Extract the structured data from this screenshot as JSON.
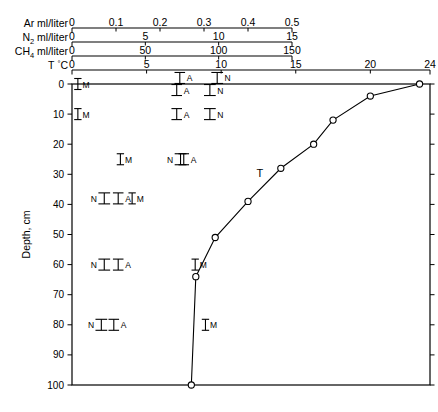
{
  "chart_data": {
    "type": "scatter",
    "title": "",
    "ylabel": "Depth, cm",
    "ylim": [
      0,
      100
    ],
    "y_ticks": [
      0,
      10,
      20,
      30,
      40,
      50,
      60,
      70,
      80,
      90,
      100
    ],
    "grid": false,
    "legend": "inline-letter-labels",
    "top_axes": [
      {
        "id": "ar",
        "name": "Ar",
        "units": "ml/liter",
        "letter": "A",
        "range": [
          0,
          0.5
        ],
        "ticks": [
          0,
          0.1,
          0.2,
          0.3,
          0.4,
          0.5
        ],
        "tick_labels": [
          "0",
          "0.1",
          "0.2",
          "0.3",
          "0.4",
          "0.5"
        ],
        "axis_end_value": 0.5
      },
      {
        "id": "n2",
        "name": "N2",
        "units": "ml/liter",
        "letter": "N",
        "range": [
          0,
          15
        ],
        "ticks": [
          0,
          5,
          10,
          15
        ],
        "tick_labels": [
          "0",
          "5",
          "10",
          "15"
        ],
        "axis_end_value": 15
      },
      {
        "id": "ch4",
        "name": "CH4",
        "units": "ml/liter",
        "letter": "M",
        "range": [
          0,
          150
        ],
        "ticks": [
          0,
          50,
          100,
          150
        ],
        "tick_labels": [
          "0",
          "50",
          "100",
          "150"
        ],
        "axis_end_value": 150
      },
      {
        "id": "t",
        "name": "T",
        "units": "°C",
        "letter": "T",
        "range": [
          0,
          24
        ],
        "ticks": [
          0,
          5,
          10,
          15,
          20,
          24
        ],
        "tick_labels": [
          "0",
          "5",
          "10",
          "15",
          "20",
          "24"
        ],
        "axis_end_value": 24
      }
    ],
    "series": [
      {
        "name": "T",
        "letter": "T",
        "axis": "t",
        "marker": "open-circle",
        "line": true,
        "label_position": {
          "value": 12.6,
          "depth": 31
        },
        "points": [
          {
            "value": 23.3,
            "depth": 0
          },
          {
            "value": 20.0,
            "depth": 4
          },
          {
            "value": 17.5,
            "depth": 12
          },
          {
            "value": 16.2,
            "depth": 20
          },
          {
            "value": 14.0,
            "depth": 28
          },
          {
            "value": 11.8,
            "depth": 39
          },
          {
            "value": 9.6,
            "depth": 51
          },
          {
            "value": 8.3,
            "depth": 64
          },
          {
            "value": 8.0,
            "depth": 100
          }
        ]
      },
      {
        "name": "CH4",
        "letter": "M",
        "axis": "ch4",
        "marker": "error-bar",
        "line": false,
        "points": [
          {
            "value": 4.0,
            "depth": 0,
            "err": 2.5
          },
          {
            "value": 4.0,
            "depth": 10,
            "err": 2.5
          },
          {
            "value": 33.0,
            "depth": 25,
            "err": 2.5
          },
          {
            "value": 41.0,
            "depth": 38,
            "err": 2.5
          },
          {
            "value": 84.0,
            "depth": 60,
            "err": 2.5
          },
          {
            "value": 91.0,
            "depth": 80,
            "err": 2.5
          }
        ]
      },
      {
        "name": "Ar",
        "letter": "A",
        "axis": "ar",
        "marker": "error-bar",
        "line": false,
        "points": [
          {
            "value": 0.245,
            "depth": -2,
            "err": 0.012
          },
          {
            "value": 0.238,
            "depth": 2,
            "err": 0.012
          },
          {
            "value": 0.238,
            "depth": 10,
            "err": 0.012
          },
          {
            "value": 0.254,
            "depth": 25,
            "err": 0.012
          },
          {
            "value": 0.105,
            "depth": 38,
            "err": 0.012
          },
          {
            "value": 0.105,
            "depth": 60,
            "err": 0.012
          },
          {
            "value": 0.095,
            "depth": 80,
            "err": 0.012
          }
        ]
      },
      {
        "name": "N2",
        "letter": "N",
        "axis": "n2",
        "marker": "error-bar",
        "line": false,
        "points": [
          {
            "value": 9.9,
            "depth": -2,
            "err": 0.4
          },
          {
            "value": 9.4,
            "depth": 2,
            "err": 0.4
          },
          {
            "value": 9.4,
            "depth": 10,
            "err": 0.4
          },
          {
            "value": 7.4,
            "depth": 25,
            "err": 0.4
          },
          {
            "value": 2.2,
            "depth": 38,
            "err": 0.4
          },
          {
            "value": 2.2,
            "depth": 60,
            "err": 0.4
          },
          {
            "value": 2.0,
            "depth": 80,
            "err": 0.4
          }
        ]
      }
    ]
  },
  "figure": {
    "depth_axis_title": "Depth, cm"
  }
}
